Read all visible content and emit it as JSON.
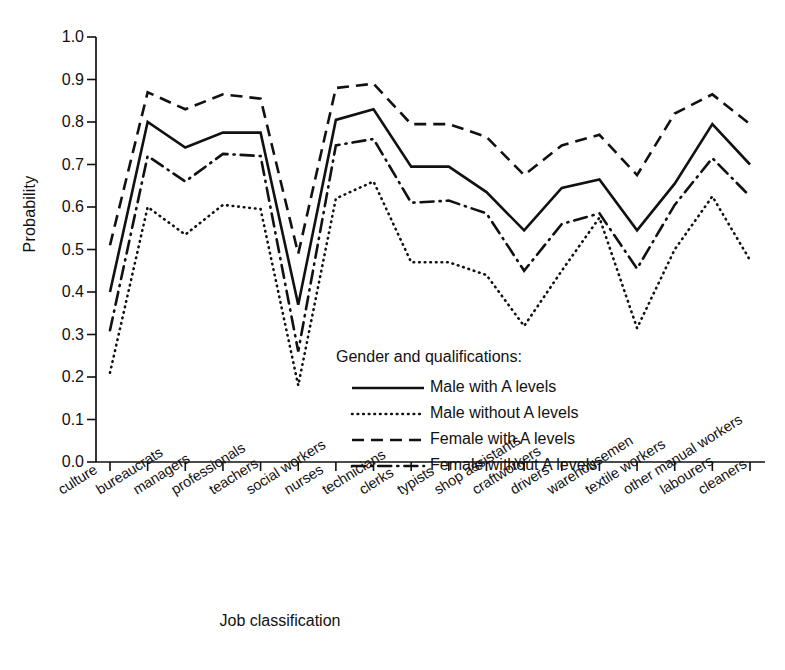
{
  "chart_data": {
    "type": "line",
    "title": "",
    "xlabel": "Job classification",
    "ylabel": "Probability",
    "ylim": [
      0.0,
      1.0
    ],
    "yticks": [
      "0.0",
      "0.1",
      "0.2",
      "0.3",
      "0.4",
      "0.5",
      "0.6",
      "0.7",
      "0.8",
      "0.9",
      "1.0"
    ],
    "grid": false,
    "legend_position": "inside-lower-right",
    "legend_title": "Gender and qualifications:",
    "categories": [
      "culture",
      "bureaucrats",
      "managers",
      "professionals",
      "teachers",
      "social workers",
      "nurses",
      "technicians",
      "clerks",
      "typists",
      "shop assistants",
      "craftworkers",
      "drivers",
      "warehousemen",
      "textile workers",
      "other manual workers",
      "labourers",
      "cleaners"
    ],
    "series": [
      {
        "name": "Male with A levels",
        "style": "solid",
        "values": [
          0.4,
          0.8,
          0.74,
          0.775,
          0.775,
          0.37,
          0.805,
          0.83,
          0.695,
          0.695,
          0.635,
          0.545,
          0.645,
          0.665,
          0.545,
          0.655,
          0.795,
          0.7
        ]
      },
      {
        "name": "Male without A levels",
        "style": "dotted",
        "values": [
          0.21,
          0.6,
          0.535,
          0.605,
          0.595,
          0.18,
          0.62,
          0.66,
          0.47,
          0.47,
          0.44,
          0.32,
          0.45,
          0.575,
          0.315,
          0.5,
          0.625,
          0.475
        ]
      },
      {
        "name": "Female with A levels",
        "style": "dashed",
        "values": [
          0.51,
          0.87,
          0.83,
          0.865,
          0.855,
          0.49,
          0.88,
          0.89,
          0.795,
          0.795,
          0.765,
          0.675,
          0.745,
          0.77,
          0.675,
          0.82,
          0.865,
          0.795
        ]
      },
      {
        "name": "Female without A levels",
        "style": "dashdot",
        "values": [
          0.31,
          0.72,
          0.66,
          0.725,
          0.72,
          0.26,
          0.745,
          0.76,
          0.61,
          0.615,
          0.585,
          0.45,
          0.56,
          0.585,
          0.455,
          0.605,
          0.715,
          0.625
        ]
      }
    ]
  }
}
